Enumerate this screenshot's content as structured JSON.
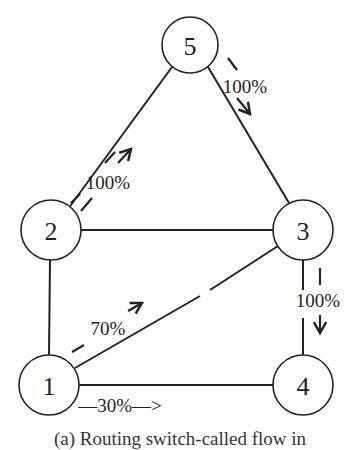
{
  "diagram": {
    "nodes": [
      {
        "id": "1",
        "label": "1",
        "x": 49,
        "y": 385
      },
      {
        "id": "2",
        "label": "2",
        "x": 51,
        "y": 230
      },
      {
        "id": "3",
        "label": "3",
        "x": 303,
        "y": 230
      },
      {
        "id": "4",
        "label": "4",
        "x": 303,
        "y": 385
      },
      {
        "id": "5",
        "label": "5",
        "x": 190,
        "y": 45
      }
    ],
    "edges": [
      [
        "5",
        "2"
      ],
      [
        "5",
        "3"
      ],
      [
        "2",
        "3"
      ],
      [
        "2",
        "1"
      ],
      [
        "1",
        "3"
      ],
      [
        "1",
        "4"
      ],
      [
        "3",
        "4"
      ]
    ],
    "flows": [
      {
        "from": "2",
        "to": "5",
        "label": "100%"
      },
      {
        "from": "5",
        "to": "3",
        "label": "100%"
      },
      {
        "from": "3",
        "to": "4",
        "label": "100%"
      },
      {
        "from": "1",
        "to": "3",
        "label": "70%"
      },
      {
        "from": "1",
        "to": "4",
        "label": "30%"
      }
    ],
    "labels": {
      "flow_2_5": "100%",
      "flow_5_3": "100%",
      "flow_3_4": "100%",
      "flow_1_3": "70%",
      "flow_1_4": "—30%—>"
    },
    "caption": "(a) Routing switch-called flow in"
  }
}
